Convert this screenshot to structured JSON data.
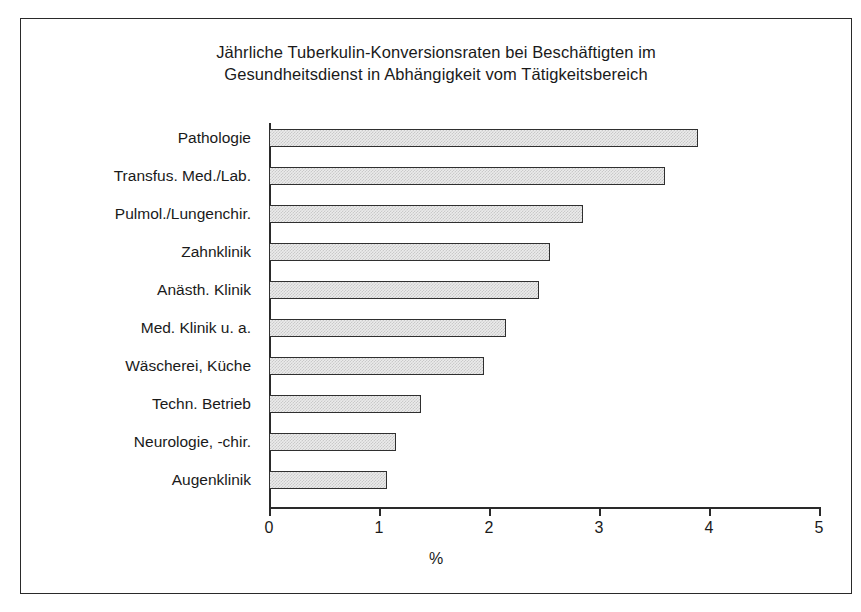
{
  "chart_data": {
    "type": "bar",
    "orientation": "horizontal",
    "title": "Jährliche Tuberkulin-Konversionsraten bei Beschäftigten im Gesundheitsdienst in Abhängigkeit vom Tätigkeitsbereich",
    "title_lines": [
      "Jährliche Tuberkulin-Konversionsraten bei Beschäftigten im",
      "Gesundheitsdienst in Abhängigkeit vom Tätigkeitsbereich"
    ],
    "xlabel": "%",
    "ylabel": "",
    "xlim": [
      0,
      5
    ],
    "xticks": [
      0,
      1,
      2,
      3,
      4,
      5
    ],
    "xtick_labels": [
      "0",
      "1",
      "2",
      "3",
      "4",
      "5"
    ],
    "grid": false,
    "legend": false,
    "categories": [
      "Pathologie",
      "Transfus. Med./Lab.",
      "Pulmol./Lungenchir.",
      "Zahnklinik",
      "Anästh. Klinik",
      "Med. Klinik u. a.",
      "Wäscherei, Küche",
      "Techn. Betrieb",
      "Neurologie, -chir.",
      "Augenklinik"
    ],
    "values": [
      3.9,
      3.6,
      2.85,
      2.55,
      2.45,
      2.15,
      1.95,
      1.38,
      1.15,
      1.07
    ],
    "bar_fill_color": "#ebebeb",
    "bar_edge_color": "#2f2f2f",
    "axis_color": "#2a2a2a",
    "background_color": "#ffffff"
  }
}
